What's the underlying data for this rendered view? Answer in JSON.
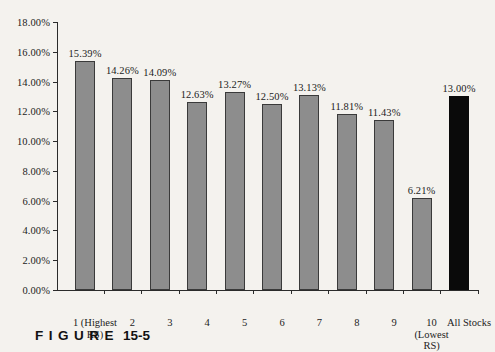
{
  "caption": {
    "word": "FIGURE",
    "number": "15-5"
  },
  "chart_data": {
    "type": "bar",
    "title": "",
    "xlabel": "",
    "ylabel": "",
    "ylim": [
      0,
      18
    ],
    "ytick_step": 2,
    "grid": false,
    "legend": "none",
    "value_label_format": "percent-2dp",
    "categories": [
      "1 (Highest RS)",
      "2",
      "3",
      "4",
      "5",
      "6",
      "7",
      "8",
      "9",
      "10 (Lowest RS)",
      "All Stocks"
    ],
    "category_lines": [
      [
        "1 (Highest",
        "RS)"
      ],
      [
        "2",
        ""
      ],
      [
        "3",
        ""
      ],
      [
        "4",
        ""
      ],
      [
        "5",
        ""
      ],
      [
        "6",
        ""
      ],
      [
        "7",
        ""
      ],
      [
        "8",
        ""
      ],
      [
        "9",
        ""
      ],
      [
        "10",
        "(Lowest"
      ],
      [
        "All Stocks",
        ""
      ]
    ],
    "category_line3": [
      "",
      "",
      "",
      "",
      "",
      "",
      "",
      "",
      "",
      "RS)",
      ""
    ],
    "values": [
      15.39,
      14.26,
      14.09,
      12.63,
      13.27,
      12.5,
      13.13,
      11.81,
      11.43,
      6.21,
      13.0
    ],
    "value_labels": [
      "15.39%",
      "14.26%",
      "14.09%",
      "12.63%",
      "13.27%",
      "12.50%",
      "13.13%",
      "11.81%",
      "11.43%",
      "6.21%",
      "13.00%"
    ],
    "ytick_labels": [
      "0.00%",
      "2.00%",
      "4.00%",
      "6.00%",
      "8.00%",
      "10.00%",
      "12.00%",
      "14.00%",
      "16.00%",
      "18.00%"
    ],
    "ytick_values": [
      0,
      2,
      4,
      6,
      8,
      10,
      12,
      14,
      16,
      18
    ],
    "bar_colors": [
      "#8d8d8d",
      "#8d8d8d",
      "#8d8d8d",
      "#8d8d8d",
      "#8d8d8d",
      "#8d8d8d",
      "#8d8d8d",
      "#8d8d8d",
      "#8d8d8d",
      "#8d8d8d",
      "#0a0a0a"
    ],
    "highlight_index": 10,
    "colors": {
      "bar_fill": "#8d8d8d",
      "bar_stroke": "#3a3a3a",
      "highlight_fill": "#0a0a0a",
      "axis": "#2b2b2b",
      "text": "#1c1c1c",
      "background": "#f4f2ee"
    }
  }
}
